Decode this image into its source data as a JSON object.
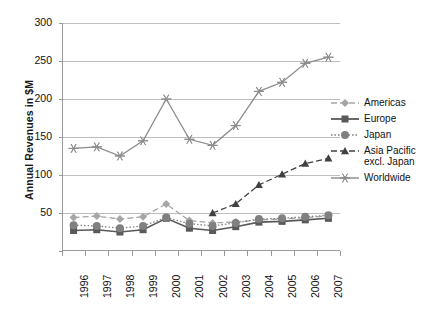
{
  "chart_data": {
    "type": "line",
    "title": "",
    "xlabel": "",
    "ylabel": "Annual Revenues in $M",
    "categories": [
      "1996",
      "1997",
      "1998",
      "1999",
      "2000",
      "2001",
      "2002",
      "2003",
      "2004",
      "2005",
      "2006",
      "2007"
    ],
    "ylim": [
      0,
      300
    ],
    "yticks": [
      0,
      50,
      100,
      150,
      200,
      250,
      300
    ],
    "ytick_labels": [
      "0",
      "50",
      "100",
      "150",
      "200",
      "250",
      "300"
    ],
    "grid": true,
    "legend_position": "right",
    "series": [
      {
        "name": "Americas",
        "marker": "diamond",
        "line_style": "dashed",
        "color": "#a6a6a6",
        "values": [
          44,
          46,
          42,
          45,
          62,
          40,
          37,
          38,
          41,
          42,
          44,
          46
        ]
      },
      {
        "name": "Europe",
        "marker": "square",
        "line_style": "solid",
        "color": "#595959",
        "values": [
          27,
          28,
          25,
          28,
          43,
          30,
          27,
          32,
          38,
          39,
          41,
          43
        ]
      },
      {
        "name": "Japan",
        "marker": "circle",
        "line_style": "dotted",
        "color": "#808080",
        "values": [
          34,
          33,
          30,
          33,
          44,
          36,
          33,
          37,
          42,
          43,
          45,
          47
        ]
      },
      {
        "name": "Asia Pacific\nexcl. Japan",
        "marker": "triangle",
        "line_style": "dashed",
        "color": "#404040",
        "values": [
          null,
          null,
          null,
          null,
          null,
          null,
          50,
          62,
          87,
          101,
          115,
          122
        ]
      },
      {
        "name": "Worldwide",
        "marker": "asterisk",
        "line_style": "solid",
        "color": "#8c8c8c",
        "values": [
          135,
          137,
          125,
          145,
          200,
          147,
          139,
          165,
          210,
          222,
          247,
          255
        ]
      }
    ]
  },
  "legend": {
    "items": [
      {
        "label": "Americas"
      },
      {
        "label": "Europe"
      },
      {
        "label": "Japan"
      },
      {
        "label": "Asia Pacific\nexcl. Japan"
      },
      {
        "label": "Worldwide"
      }
    ]
  }
}
